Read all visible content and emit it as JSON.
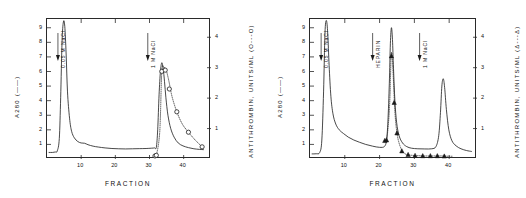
{
  "figure": {
    "panels": [
      {
        "letter": "A",
        "xlabel": "FRACTION",
        "ylabel_left": "A280 (——)",
        "ylabel_right": "ANTITHROMBIN, UNITS/ML (O---O)",
        "xticks": [
          "10",
          "20",
          "30",
          "40"
        ],
        "yticks_left": [
          "1",
          "2",
          "3",
          "4",
          "5",
          "6",
          "7",
          "8",
          "9"
        ],
        "yticks_right": [
          "1",
          "2",
          "3",
          "4"
        ],
        "annotations": [
          "0.05 M NaCl",
          "1 M NaCl"
        ]
      },
      {
        "letter": "B",
        "xlabel": "FRACTION",
        "ylabel_left": "A280 (——)",
        "ylabel_right": "ANTITHROMBIN, UNITS/ML (Δ---Δ)",
        "xticks": [
          "10",
          "20",
          "30",
          "40"
        ],
        "yticks_left": [
          "1",
          "2",
          "3",
          "4",
          "5",
          "6",
          "7",
          "8",
          "9"
        ],
        "yticks_right": [
          "1",
          "2",
          "3",
          "4"
        ],
        "annotations": [
          "0.05 M NaCl",
          "HEPARIN",
          "1 M NaCl"
        ]
      }
    ]
  },
  "chart_data": [
    {
      "type": "line",
      "title": "A",
      "xlabel": "FRACTION",
      "ylabel": "A280",
      "ylabel_right": "ANTITHROMBIN, UNITS/ML",
      "xlim": [
        0,
        48
      ],
      "ylim": [
        0,
        9.6
      ],
      "ylim_right": [
        0,
        4.6
      ],
      "grid": false,
      "legend": "none",
      "annotations": [
        {
          "text": "0.05 M NaCl",
          "x": 3.2,
          "arrow": true
        },
        {
          "text": "1 M NaCl",
          "x": 29.5,
          "arrow": true
        }
      ],
      "series": [
        {
          "name": "A280",
          "axis": "left",
          "style": "solid",
          "marker": "none",
          "x": [
            0.6,
            1.6,
            2.4,
            3.0,
            3.6,
            4.0,
            4.4,
            4.8,
            5.2,
            5.6,
            6.0,
            6.6,
            7.2,
            8.0,
            9.0,
            10.0,
            11.0,
            12.0,
            13.5,
            15.0,
            17.0,
            19.0,
            21.0,
            23.0,
            25.0,
            27.0,
            29.0,
            30.5,
            31.5,
            32.0,
            32.4,
            32.8,
            33.2,
            33.6,
            34.0,
            34.4,
            34.8,
            35.4,
            36.2,
            37.2,
            38.4,
            39.8,
            41.4,
            43.0,
            44.6,
            45.8
          ],
          "y": [
            0.45,
            0.45,
            0.48,
            0.55,
            1.4,
            4.2,
            8.0,
            9.4,
            9.1,
            7.2,
            4.6,
            2.8,
            1.9,
            1.45,
            1.2,
            1.1,
            1.08,
            0.98,
            0.88,
            0.82,
            0.76,
            0.72,
            0.7,
            0.69,
            0.7,
            0.71,
            0.72,
            0.74,
            0.76,
            0.8,
            2.0,
            4.4,
            6.0,
            6.6,
            6.2,
            5.3,
            4.2,
            3.0,
            2.1,
            1.5,
            1.1,
            0.9,
            0.78,
            0.7,
            0.66,
            0.64
          ]
        },
        {
          "name": "ANTITHROMBIN",
          "axis": "right",
          "style": "dotted",
          "marker": "open-circle",
          "x": [
            31.5,
            32.0,
            33.0,
            33.6,
            34.2,
            34.8,
            35.6,
            36.6,
            38.0,
            39.6,
            41.4,
            43.4,
            45.4
          ],
          "y": [
            0.1,
            0.12,
            0.9,
            2.88,
            3.0,
            2.95,
            2.6,
            2.05,
            1.55,
            1.15,
            0.88,
            0.62,
            0.4
          ],
          "markers_x": [
            31.6,
            32.0,
            33.6,
            34.6,
            35.8,
            38.0,
            41.4,
            45.4
          ],
          "markers_y": [
            0.1,
            0.12,
            2.88,
            2.92,
            2.3,
            1.55,
            0.88,
            0.4
          ]
        }
      ]
    },
    {
      "type": "line",
      "title": "B",
      "xlabel": "FRACTION",
      "ylabel": "A280",
      "ylabel_right": "ANTITHROMBIN, UNITS/ML",
      "xlim": [
        0,
        48
      ],
      "ylim": [
        0,
        9.6
      ],
      "ylim_right": [
        0,
        4.6
      ],
      "grid": false,
      "legend": "none",
      "annotations": [
        {
          "text": "0.05 M NaCl",
          "x": 3.2,
          "arrow": true
        },
        {
          "text": "HEPARIN",
          "x": 18.0,
          "arrow": true
        },
        {
          "text": "1 M NaCl",
          "x": 31.5,
          "arrow": true
        }
      ],
      "series": [
        {
          "name": "A280",
          "axis": "left",
          "style": "solid",
          "marker": "none",
          "x": [
            0.6,
            1.8,
            2.8,
            3.4,
            3.9,
            4.3,
            4.7,
            5.1,
            5.5,
            6.0,
            6.6,
            7.4,
            8.4,
            9.6,
            11.0,
            12.6,
            14.2,
            16.0,
            18.0,
            20.0,
            21.4,
            22.0,
            22.4,
            22.8,
            23.1,
            23.4,
            23.7,
            24.0,
            24.4,
            24.9,
            25.6,
            26.6,
            27.8,
            29.2,
            31.0,
            33.0,
            35.0,
            36.2,
            37.0,
            37.5,
            37.9,
            38.3,
            38.7,
            39.2,
            39.9,
            40.8,
            42.0,
            43.4,
            45.0,
            46.4
          ],
          "y": [
            0.35,
            0.36,
            0.45,
            1.3,
            4.6,
            8.6,
            9.5,
            8.6,
            6.4,
            4.3,
            3.1,
            2.4,
            2.0,
            1.75,
            1.5,
            1.3,
            1.15,
            1.0,
            0.88,
            0.8,
            0.86,
            1.3,
            2.6,
            5.2,
            7.9,
            9.0,
            8.2,
            6.2,
            4.0,
            2.5,
            1.6,
            1.1,
            0.85,
            0.74,
            0.7,
            0.69,
            0.7,
            0.85,
            1.6,
            3.2,
            5.0,
            5.5,
            4.9,
            3.4,
            2.0,
            1.25,
            0.9,
            0.7,
            0.58,
            0.52
          ]
        },
        {
          "name": "ANTITHROMBIN",
          "axis": "right",
          "style": "dotted",
          "marker": "filled-triangle",
          "x": [
            21.4,
            22.0,
            22.6,
            23.0,
            23.3,
            23.6,
            24.0,
            24.4,
            25.0,
            25.8,
            26.8,
            28.0,
            29.4,
            31.0,
            32.8,
            34.6,
            36.4,
            38.0,
            39.6,
            41.0
          ],
          "y": [
            0.6,
            0.62,
            1.25,
            2.1,
            3.35,
            3.4,
            2.55,
            1.55,
            0.85,
            0.45,
            0.22,
            0.14,
            0.12,
            0.11,
            0.1,
            0.1,
            0.1,
            0.1,
            0.09,
            0.09
          ],
          "markers_x": [
            21.5,
            22.0,
            23.4,
            24.2,
            25.0,
            26.4,
            28.2,
            30.2,
            32.4,
            34.6,
            36.6,
            38.6
          ],
          "markers_y": [
            0.6,
            0.62,
            3.38,
            1.85,
            0.85,
            0.26,
            0.14,
            0.11,
            0.1,
            0.1,
            0.1,
            0.09
          ]
        }
      ]
    }
  ]
}
